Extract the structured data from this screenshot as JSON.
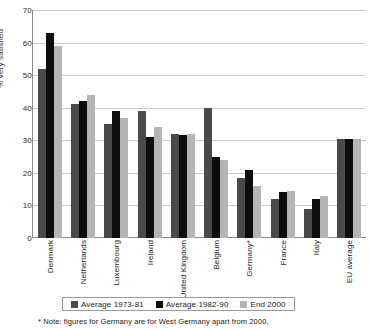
{
  "chart_data": {
    "type": "bar",
    "title": "",
    "xlabel": "",
    "ylabel": "% very satisfied",
    "ylim": [
      0,
      70
    ],
    "ytick_step": 10,
    "yticks": [
      0,
      10,
      20,
      30,
      40,
      50,
      60,
      70
    ],
    "grid": true,
    "legend_position": "bottom",
    "categories": [
      "Denmark",
      "Netherlands",
      "Luxembourg",
      "Ireland",
      "United Kingdom",
      "Belgium",
      "Germany*",
      "France",
      "Italy",
      "EU average"
    ],
    "series": [
      {
        "name": "Average 1973-81",
        "color": "#4a4a4a",
        "values": [
          52,
          41,
          35,
          39,
          32,
          40,
          18.5,
          12,
          9,
          30.5
        ]
      },
      {
        "name": "Average 1982-90",
        "color": "#0d0d0d",
        "values": [
          63,
          42,
          39,
          31,
          31.5,
          25,
          21,
          14,
          12,
          30.5
        ]
      },
      {
        "name": "End 2000",
        "color": "#b5b5b5",
        "values": [
          59,
          44,
          37,
          34,
          32,
          24,
          16,
          14.5,
          13,
          30.5
        ]
      }
    ],
    "footnote": "* Note: figures for Germany are for West Germany apart from 2000,"
  }
}
